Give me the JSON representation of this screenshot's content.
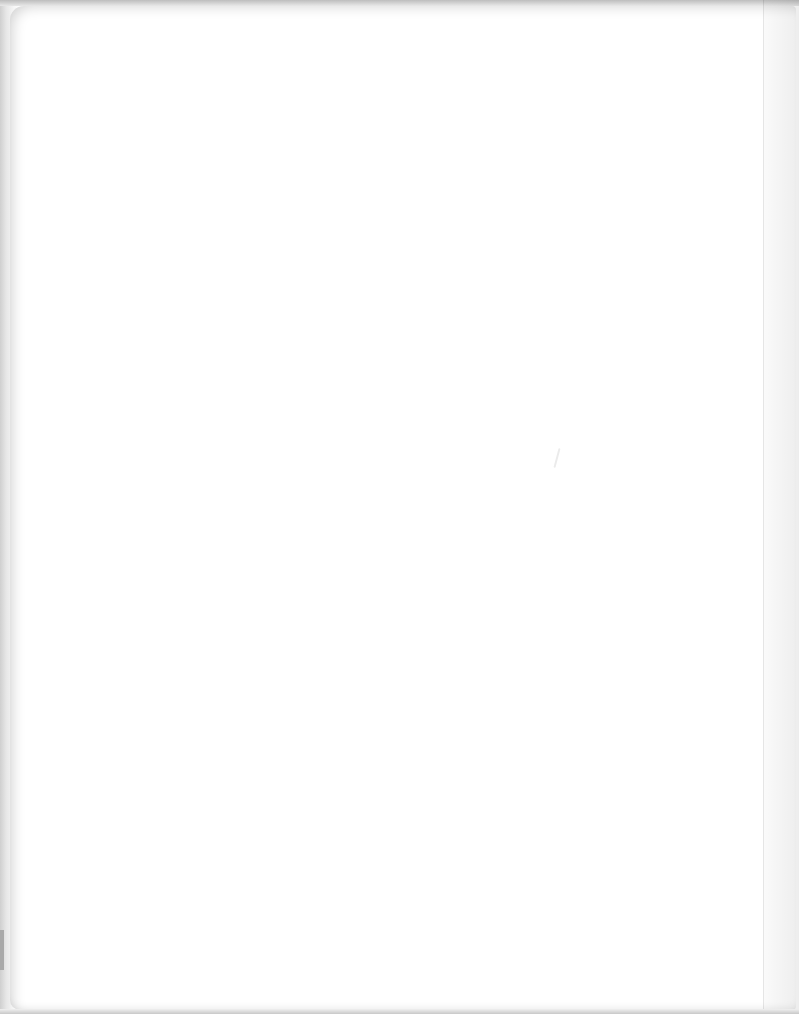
{
  "document": {
    "type": "scanned-page",
    "state": "blank",
    "text": "",
    "background_color": "#ffffff",
    "edge_color": "#cfcfcf"
  }
}
